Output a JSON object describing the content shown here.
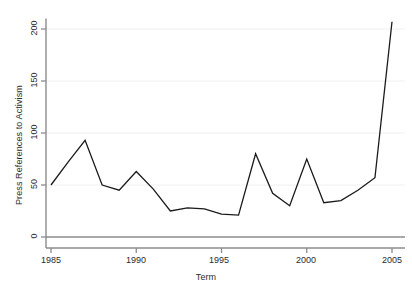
{
  "chart_data": {
    "type": "line",
    "title": "",
    "xlabel": "Term",
    "ylabel": "Press References to Activism",
    "x": [
      1985,
      1986,
      1987,
      1988,
      1989,
      1990,
      1991,
      1992,
      1993,
      1994,
      1995,
      1996,
      1997,
      1998,
      1999,
      2000,
      2001,
      2002,
      2003,
      2004,
      2005
    ],
    "values": [
      50,
      72,
      93,
      50,
      45,
      63,
      46,
      25,
      28,
      27,
      22,
      21,
      80,
      42,
      30,
      75,
      33,
      35,
      45,
      57,
      207
    ],
    "series": [
      {
        "name": "Press References to Activism",
        "values": [
          50,
          72,
          93,
          50,
          45,
          63,
          46,
          25,
          28,
          27,
          22,
          21,
          80,
          42,
          30,
          75,
          33,
          35,
          45,
          57,
          207
        ]
      }
    ],
    "xlim": [
      1985,
      2005
    ],
    "ylim": [
      0,
      210
    ],
    "xticks": [
      1985,
      1990,
      1995,
      2000,
      2005
    ],
    "xtick_labels": [
      "1985",
      "1990",
      "1995",
      "2000",
      "2005"
    ],
    "yticks": [
      0,
      50,
      100,
      150,
      200
    ],
    "ytick_labels": [
      "0",
      "50",
      "100",
      "150",
      "200"
    ],
    "grid": "horizontal",
    "legend": "none",
    "line_color": "#1a1a1a",
    "grid_color": "#f0f0f0",
    "axis_color": "#8c8c8c",
    "text_color": "#2b2b2b",
    "background": "#ffffff"
  }
}
